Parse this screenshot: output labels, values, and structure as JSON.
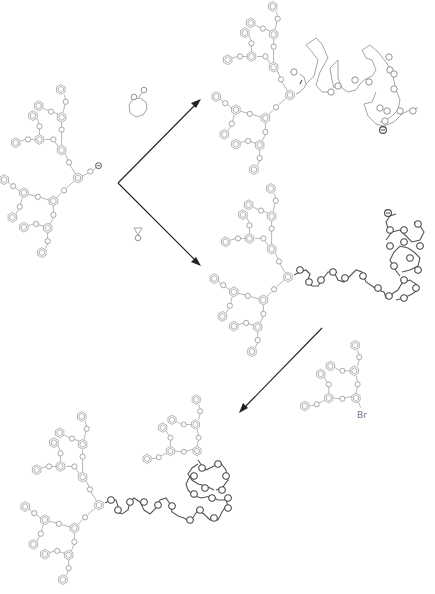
{
  "scheme": {
    "type": "reaction-scheme",
    "starting_material": {
      "label": "dendron alkoxide initiator",
      "charge_symbol": "⊖"
    },
    "reagents": {
      "upper": {
        "label": "lactone (cyclic ester)",
        "glyph": "ring-ester"
      },
      "lower": {
        "label": "ethylene oxide (epoxide)",
        "glyph": "epoxide"
      },
      "third": {
        "label": "benzyl bromide dendron",
        "atom_label": "Br"
      }
    },
    "products": [
      {
        "label": "dendron-polyester living chain",
        "charge_symbol": "⊖"
      },
      {
        "label": "dendron-polyether living chain",
        "charge_symbol": "⊖"
      },
      {
        "label": "dumbbell dendron-PEO-dendron"
      }
    ],
    "arrows": [
      {
        "name": "arrow-to-polyester",
        "from": [
          118,
          183
        ],
        "to": [
          200,
          100
        ]
      },
      {
        "name": "arrow-to-polyether",
        "from": [
          118,
          183
        ],
        "to": [
          200,
          265
        ]
      },
      {
        "name": "arrow-to-dumbbell",
        "from": [
          322,
          328
        ],
        "to": [
          240,
          412
        ]
      }
    ]
  }
}
